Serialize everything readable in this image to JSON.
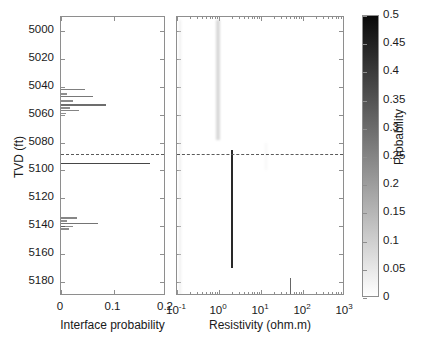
{
  "figure": {
    "type": "two-panel-log-plot",
    "background": "#ffffff"
  },
  "yaxis": {
    "label": "TVD (ft)",
    "ticks": [
      5000,
      5020,
      5040,
      5060,
      5080,
      5100,
      5120,
      5140,
      5160,
      5180
    ],
    "tick_labels": [
      "5000",
      "5020",
      "5040",
      "5060",
      "5080",
      "5100",
      "5120",
      "5140",
      "5160",
      "5180"
    ],
    "min": 4990,
    "max": 5190,
    "direction": "increasing-downward"
  },
  "reference_line": {
    "depth": 5088,
    "style": "dotted",
    "color": "#5a5a5a"
  },
  "colorbar": {
    "title": "Probability",
    "min": 0,
    "max": 0.5,
    "colormap": "grayscale-inverted",
    "low_color": "#ffffff",
    "high_color": "#0a0a0a",
    "ticks": [
      0,
      0.05,
      0.1,
      0.15,
      0.2,
      0.25,
      0.3,
      0.35,
      0.4,
      0.45,
      0.5
    ],
    "tick_labels": [
      "0",
      "0.05",
      "0.1",
      "0.15",
      "0.2",
      "0.25",
      "0.3",
      "0.35",
      "0.4",
      "0.45",
      "0.5"
    ]
  },
  "chart_data": [
    {
      "type": "line",
      "panel": "left",
      "title": "",
      "xlabel": "Interface probability",
      "ylabel": "TVD (ft)",
      "xlim": [
        0,
        0.2
      ],
      "ylim": [
        4990,
        5190
      ],
      "xticks": [
        0,
        0.1,
        0.2
      ],
      "xtick_labels": [
        "0",
        "0.1",
        "0.2"
      ],
      "yticks": [
        5000,
        5020,
        5040,
        5060,
        5080,
        5100,
        5120,
        5140,
        5160,
        5180
      ],
      "grid": false,
      "legend": "none",
      "orientation": "horizontal-spikes",
      "x": [
        5042,
        5045,
        5047,
        5050,
        5053,
        5055,
        5057,
        5059,
        5095,
        5134,
        5136,
        5138,
        5140,
        5142
      ],
      "values": [
        0.045,
        0.012,
        0.06,
        0.022,
        0.085,
        0.018,
        0.035,
        0.01,
        0.17,
        0.03,
        0.012,
        0.07,
        0.022,
        0.015
      ],
      "series": [
        {
          "name": "Interface probability",
          "depths": [
            5042,
            5045,
            5047,
            5050,
            5053,
            5055,
            5057,
            5059,
            5095,
            5134,
            5136,
            5138,
            5140,
            5142
          ],
          "values": [
            0.045,
            0.012,
            0.06,
            0.022,
            0.085,
            0.018,
            0.035,
            0.01,
            0.17,
            0.03,
            0.012,
            0.07,
            0.022,
            0.015
          ]
        }
      ]
    },
    {
      "type": "heatmap",
      "panel": "right",
      "title": "",
      "xlabel": "Resistivity (ohm.m)",
      "ylabel": "TVD (ft)",
      "xscale": "log",
      "xlim": [
        0.1,
        1000
      ],
      "ylim": [
        4990,
        5190
      ],
      "xticks": [
        0.1,
        1,
        10,
        100,
        1000
      ],
      "xtick_labels": [
        "10-1",
        "100",
        "101",
        "102",
        "103"
      ],
      "xtick_mantissa": [
        "10",
        "10",
        "10",
        "10",
        "10"
      ],
      "xtick_exponents": [
        "-1",
        "0",
        "1",
        "2",
        "3"
      ],
      "yticks": [
        5000,
        5020,
        5040,
        5060,
        5080,
        5100,
        5120,
        5140,
        5160,
        5180
      ],
      "grid": false,
      "legend": "colorbar",
      "colorbar_range": [
        0,
        0.5
      ],
      "features": [
        {
          "name": "upper-diffuse-band",
          "resistivity_center": 0.95,
          "resistivity_width_decades": 0.1,
          "depth_top": 4992,
          "depth_bottom": 5078,
          "peak_probability": 0.1,
          "shade": "light-gray"
        },
        {
          "name": "upper-sharp-line",
          "resistivity_center": 2.0,
          "resistivity_width_decades": 0.012,
          "depth_top": 5085,
          "depth_bottom": 5170,
          "peak_probability": 0.42,
          "shade": "dark-gray"
        },
        {
          "name": "mid-sharp-line",
          "resistivity_center": 50.0,
          "resistivity_width_decades": 0.012,
          "depth_top": 5177,
          "depth_bottom": 5244,
          "peak_probability": 0.3,
          "shade": "medium-gray"
        },
        {
          "name": "lower-diffuse-band",
          "resistivity_center": 0.95,
          "resistivity_width_decades": 0.1,
          "depth_top": 5252,
          "depth_bottom": 5362,
          "peak_probability": 0.12,
          "shade": "light-gray"
        },
        {
          "name": "faint-upper-left-line",
          "resistivity_center": 0.115,
          "resistivity_width_decades": 0.006,
          "depth_top": 4992,
          "depth_bottom": 5190,
          "peak_probability": 0.05,
          "shade": "very-light-gray"
        },
        {
          "name": "faint-patch",
          "resistivity_center": 13.0,
          "resistivity_width_decades": 0.06,
          "depth_top": 5080,
          "depth_bottom": 5100,
          "peak_probability": 0.03,
          "shade": "very-light-gray"
        }
      ]
    }
  ]
}
